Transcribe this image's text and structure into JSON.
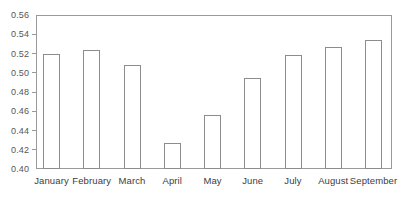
{
  "chart_data": {
    "type": "bar",
    "title": "",
    "subtitle": "",
    "xlabel": "",
    "ylabel": "",
    "categories": [
      "January",
      "February",
      "March",
      "April",
      "May",
      "June",
      "July",
      "August",
      "September"
    ],
    "values": [
      0.5195,
      0.5235,
      0.5085,
      0.427,
      0.456,
      0.4945,
      0.5185,
      0.527,
      0.534
    ],
    "series": [
      {
        "name": "",
        "values": [
          0.5195,
          0.5235,
          0.5085,
          0.427,
          0.456,
          0.4945,
          0.5185,
          0.527,
          0.534
        ]
      }
    ],
    "ylim": [
      0.4,
      0.56
    ],
    "ytick_values": [
      0.4,
      0.42,
      0.44,
      0.46,
      0.48,
      0.5,
      0.52,
      0.54,
      0.56
    ],
    "ytick_labels": [
      "0.40",
      "0.42",
      "0.44",
      "0.46",
      "0.48",
      "0.50",
      "0.52",
      "0.54",
      "0.56"
    ],
    "grid": false,
    "legend": false,
    "legend_position": "none",
    "annotations": [],
    "bar_fill_color": "#ffffff",
    "bar_border_color": "#8c8c8c",
    "axis_color": "#9a9a9a",
    "background_color": "#ffffff",
    "tick_label_color": "#555555",
    "category_label_color": "#3d3d3d"
  }
}
